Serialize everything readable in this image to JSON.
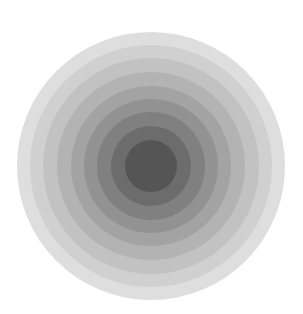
{
  "figure": {
    "center": {
      "x": 151,
      "y": 165.5
    },
    "background": "#ffffff",
    "rings": [
      {
        "radius": 134,
        "color": "#dedede"
      },
      {
        "radius": 121,
        "color": "#d0d0d0"
      },
      {
        "radius": 108,
        "color": "#c2c2c2"
      },
      {
        "radius": 94,
        "color": "#b3b3b3"
      },
      {
        "radius": 80,
        "color": "#a3a3a3"
      },
      {
        "radius": 67,
        "color": "#929292"
      },
      {
        "radius": 54,
        "color": "#808080"
      },
      {
        "radius": 40,
        "color": "#6c6c6c"
      },
      {
        "radius": 26,
        "color": "#555555"
      }
    ]
  }
}
